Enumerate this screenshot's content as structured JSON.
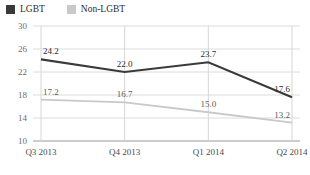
{
  "legend": {
    "entries": [
      {
        "label": "LGBT",
        "color": "#3a3a3a",
        "icon": "square-swatch"
      },
      {
        "label": "Non-LGBT",
        "color": "#c9c9c9",
        "icon": "square-swatch"
      }
    ]
  },
  "chart_data": {
    "type": "line",
    "title": "",
    "xlabel": "",
    "ylabel": "",
    "categories": [
      "Q3 2013",
      "Q4 2013",
      "Q1 2014",
      "Q2 2014"
    ],
    "series": [
      {
        "name": "LGBT",
        "color": "#3a3a3a",
        "values": [
          24.2,
          22.0,
          23.7,
          17.6
        ],
        "labels": [
          "24.2",
          "22.0",
          "23.7",
          "17.6"
        ]
      },
      {
        "name": "Non-LGBT",
        "color": "#c9c9c9",
        "values": [
          17.2,
          16.7,
          15.0,
          13.2
        ],
        "labels": [
          "17.2",
          "16.7",
          "15.0",
          "13.2"
        ]
      }
    ],
    "ylim": [
      10,
      30
    ],
    "yticks": [
      10,
      14,
      18,
      22,
      26,
      30
    ],
    "ytick_labels": [
      "10",
      "14",
      "18",
      "22",
      "26",
      "30"
    ],
    "grid": true,
    "legend_position": "top-left"
  }
}
